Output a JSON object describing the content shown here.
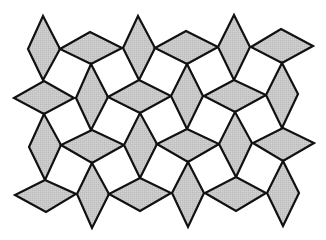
{
  "diagram": {
    "type": "tessellation",
    "colors": {
      "background": "#ffffff",
      "fill": "#c8c8c8",
      "stroke": "#111111"
    },
    "stroke_width": 2.2,
    "rhombi": [
      {
        "id": 1,
        "orientation": "vertical",
        "points": [
          [
            43,
            16
          ],
          [
            60,
            49
          ],
          [
            43,
            80
          ],
          [
            28,
            49
          ]
        ]
      },
      {
        "id": 2,
        "orientation": "horizontal",
        "points": [
          [
            90,
            32
          ],
          [
            122,
            48
          ],
          [
            91,
            64
          ],
          [
            60,
            49
          ]
        ]
      },
      {
        "id": 3,
        "orientation": "horizontal",
        "points": [
          [
            44,
            81
          ],
          [
            74,
            98
          ],
          [
            44,
            114
          ],
          [
            14,
            98
          ]
        ]
      },
      {
        "id": 4,
        "orientation": "vertical",
        "points": [
          [
            91,
            64
          ],
          [
            108,
            97
          ],
          [
            91,
            130
          ],
          [
            76,
            98
          ]
        ]
      },
      {
        "id": 5,
        "orientation": "vertical",
        "points": [
          [
            138,
            16
          ],
          [
            155,
            48
          ],
          [
            139,
            80
          ],
          [
            123,
            48
          ]
        ]
      },
      {
        "id": 6,
        "orientation": "horizontal",
        "points": [
          [
            186,
            31
          ],
          [
            218,
            47
          ],
          [
            187,
            64
          ],
          [
            155,
            48
          ]
        ]
      },
      {
        "id": 7,
        "orientation": "vertical",
        "points": [
          [
            234,
            15
          ],
          [
            250,
            47
          ],
          [
            234,
            80
          ],
          [
            218,
            47
          ]
        ]
      },
      {
        "id": 8,
        "orientation": "horizontal",
        "points": [
          [
            281,
            29
          ],
          [
            313,
            46
          ],
          [
            282,
            63
          ],
          [
            251,
            47
          ]
        ]
      },
      {
        "id": 9,
        "orientation": "horizontal",
        "points": [
          [
            139,
            80
          ],
          [
            171,
            96
          ],
          [
            140,
            113
          ],
          [
            108,
            97
          ]
        ]
      },
      {
        "id": 10,
        "orientation": "vertical",
        "points": [
          [
            187,
            64
          ],
          [
            203,
            96
          ],
          [
            187,
            129
          ],
          [
            171,
            96
          ]
        ]
      },
      {
        "id": 11,
        "orientation": "horizontal",
        "points": [
          [
            234,
            80
          ],
          [
            266,
            95
          ],
          [
            235,
            112
          ],
          [
            204,
            96
          ]
        ]
      },
      {
        "id": 12,
        "orientation": "vertical",
        "points": [
          [
            282,
            63
          ],
          [
            298,
            94
          ],
          [
            282,
            128
          ],
          [
            266,
            95
          ]
        ]
      },
      {
        "id": 13,
        "orientation": "vertical",
        "points": [
          [
            44,
            114
          ],
          [
            61,
            145
          ],
          [
            45,
            180
          ],
          [
            29,
            147
          ]
        ]
      },
      {
        "id": 14,
        "orientation": "horizontal",
        "points": [
          [
            92,
            130
          ],
          [
            124,
            145
          ],
          [
            92,
            163
          ],
          [
            61,
            145
          ]
        ]
      },
      {
        "id": 15,
        "orientation": "vertical",
        "points": [
          [
            140,
            113
          ],
          [
            157,
            144
          ],
          [
            140,
            178
          ],
          [
            124,
            145
          ]
        ]
      },
      {
        "id": 16,
        "orientation": "horizontal",
        "points": [
          [
            187,
            129
          ],
          [
            219,
            144
          ],
          [
            188,
            162
          ],
          [
            157,
            144
          ]
        ]
      },
      {
        "id": 17,
        "orientation": "vertical",
        "points": [
          [
            235,
            112
          ],
          [
            252,
            143
          ],
          [
            236,
            177
          ],
          [
            219,
            144
          ]
        ]
      },
      {
        "id": 18,
        "orientation": "horizontal",
        "points": [
          [
            283,
            128
          ],
          [
            314,
            143
          ],
          [
            283,
            161
          ],
          [
            253,
            143
          ]
        ]
      },
      {
        "id": 19,
        "orientation": "horizontal",
        "points": [
          [
            45,
            180
          ],
          [
            76,
            194
          ],
          [
            46,
            212
          ],
          [
            15,
            195
          ]
        ]
      },
      {
        "id": 20,
        "orientation": "vertical",
        "points": [
          [
            92,
            163
          ],
          [
            109,
            194
          ],
          [
            92,
            228
          ],
          [
            77,
            194
          ]
        ]
      },
      {
        "id": 21,
        "orientation": "horizontal",
        "points": [
          [
            140,
            178
          ],
          [
            171,
            193
          ],
          [
            140,
            211
          ],
          [
            109,
            194
          ]
        ]
      },
      {
        "id": 22,
        "orientation": "vertical",
        "points": [
          [
            188,
            162
          ],
          [
            204,
            193
          ],
          [
            188,
            227
          ],
          [
            172,
            193
          ]
        ]
      },
      {
        "id": 23,
        "orientation": "horizontal",
        "points": [
          [
            236,
            177
          ],
          [
            266,
            193
          ],
          [
            236,
            211
          ],
          [
            205,
            193
          ]
        ]
      },
      {
        "id": 24,
        "orientation": "vertical",
        "points": [
          [
            283,
            161
          ],
          [
            299,
            193
          ],
          [
            283,
            226
          ],
          [
            267,
            193
          ]
        ]
      }
    ]
  }
}
